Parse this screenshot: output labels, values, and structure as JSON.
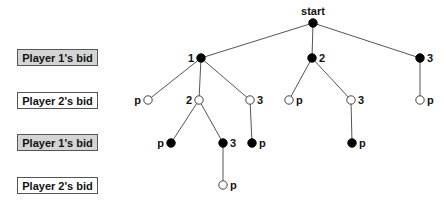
{
  "rows": [
    {
      "label": "Player 1's bid",
      "player": 1,
      "top": 49
    },
    {
      "label": "Player 2's bid",
      "player": 2,
      "top": 92
    },
    {
      "label": "Player 1's bid",
      "player": 1,
      "top": 134
    },
    {
      "label": "Player 2's bid",
      "player": 2,
      "top": 177
    }
  ],
  "colors": {
    "player1_fill": "#000000",
    "player2_fill": "#ffffff",
    "edge": "#555555",
    "p1_box": "#d4d4d4"
  },
  "tree": {
    "nodes": [
      {
        "id": "start",
        "label": "start",
        "player": 1,
        "x": 313,
        "y": 23,
        "label_pos": "top"
      },
      {
        "id": "a1",
        "label": "1",
        "player": 1,
        "x": 201,
        "y": 58,
        "label_pos": "left"
      },
      {
        "id": "a2",
        "label": "2",
        "player": 1,
        "x": 312,
        "y": 58,
        "label_pos": "right"
      },
      {
        "id": "a3",
        "label": "3",
        "player": 1,
        "x": 420,
        "y": 58,
        "label_pos": "right"
      },
      {
        "id": "b1",
        "label": "p",
        "player": 2,
        "x": 148,
        "y": 100,
        "label_pos": "left"
      },
      {
        "id": "b2",
        "label": "2",
        "player": 2,
        "x": 199,
        "y": 100,
        "label_pos": "left"
      },
      {
        "id": "b3",
        "label": "3",
        "player": 2,
        "x": 250,
        "y": 100,
        "label_pos": "right"
      },
      {
        "id": "b4",
        "label": "p",
        "player": 2,
        "x": 289,
        "y": 100,
        "label_pos": "right"
      },
      {
        "id": "b5",
        "label": "3",
        "player": 2,
        "x": 351,
        "y": 100,
        "label_pos": "right"
      },
      {
        "id": "b6",
        "label": "p",
        "player": 2,
        "x": 420,
        "y": 100,
        "label_pos": "right"
      },
      {
        "id": "c1",
        "label": "p",
        "player": 1,
        "x": 171,
        "y": 143,
        "label_pos": "left"
      },
      {
        "id": "c2",
        "label": "3",
        "player": 1,
        "x": 223,
        "y": 143,
        "label_pos": "right"
      },
      {
        "id": "c3",
        "label": "p",
        "player": 1,
        "x": 252,
        "y": 143,
        "label_pos": "right"
      },
      {
        "id": "c4",
        "label": "p",
        "player": 1,
        "x": 352,
        "y": 143,
        "label_pos": "right"
      },
      {
        "id": "d1",
        "label": "p",
        "player": 2,
        "x": 223,
        "y": 185,
        "label_pos": "right"
      }
    ],
    "edges": [
      [
        "start",
        "a1"
      ],
      [
        "start",
        "a2"
      ],
      [
        "start",
        "a3"
      ],
      [
        "a1",
        "b1"
      ],
      [
        "a1",
        "b2"
      ],
      [
        "a1",
        "b3"
      ],
      [
        "a2",
        "b4"
      ],
      [
        "a2",
        "b5"
      ],
      [
        "a3",
        "b6"
      ],
      [
        "b2",
        "c1"
      ],
      [
        "b2",
        "c2"
      ],
      [
        "b3",
        "c3"
      ],
      [
        "b5",
        "c4"
      ],
      [
        "c2",
        "d1"
      ]
    ]
  }
}
